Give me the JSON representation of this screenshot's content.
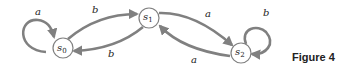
{
  "figure": {
    "caption": "Figure 4",
    "states": [
      {
        "id": "s0",
        "name": "s",
        "sub": "0"
      },
      {
        "id": "s1",
        "name": "s",
        "sub": "1"
      },
      {
        "id": "s2",
        "name": "s",
        "sub": "2"
      }
    ],
    "transitions": [
      {
        "from": "s0",
        "to": "s0",
        "label": "a"
      },
      {
        "from": "s0",
        "to": "s1",
        "label": "b"
      },
      {
        "from": "s1",
        "to": "s0",
        "label": "b"
      },
      {
        "from": "s1",
        "to": "s2",
        "label": "a"
      },
      {
        "from": "s2",
        "to": "s1",
        "label": "a"
      },
      {
        "from": "s2",
        "to": "s2",
        "label": "b"
      }
    ],
    "colors": {
      "edge": "#808080",
      "node_stroke": "#808080",
      "text": "#222222"
    }
  }
}
